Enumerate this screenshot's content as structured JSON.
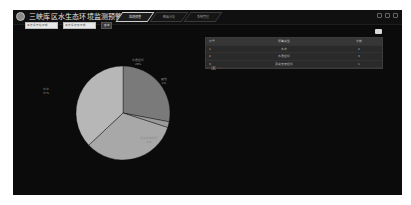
{
  "header": {
    "title": "三峡库区水生态环境监测预警平台",
    "tabs": [
      {
        "label": "监测预警",
        "active": true
      },
      {
        "label": "数据分析",
        "active": false
      },
      {
        "label": "系统管理",
        "active": false
      }
    ],
    "icons": [
      "minimize-icon",
      "settings-icon",
      "close-icon"
    ]
  },
  "toolbar": {
    "start_date": {
      "value": "",
      "placeholder": "请选择开始日期"
    },
    "end_date": {
      "value": "",
      "placeholder": "请选择结束日期"
    },
    "query_label": "查询",
    "export_icon": "export-icon"
  },
  "table": {
    "columns": [
      "序号",
      "预警类型",
      "次数"
    ],
    "rows": [
      {
        "index": "1",
        "type": "水华",
        "count": "2"
      },
      {
        "index": "2",
        "type": "水质超标",
        "count": "3"
      },
      {
        "index": "3",
        "type": "藻类密度超标",
        "count": "1"
      }
    ],
    "pagination": {
      "prev": "‹",
      "current": "1",
      "next": "›"
    }
  },
  "chart_data": {
    "type": "pie",
    "title": "",
    "slices": [
      {
        "label": "水质超标",
        "value": 28,
        "color": "#7a7a7a"
      },
      {
        "label": "其他",
        "value": 2,
        "color": "#9a9a9a"
      },
      {
        "label": "藻类密度超标",
        "value": 33,
        "color": "#a8a8a8"
      },
      {
        "label": "水华",
        "value": 37,
        "color": "#b7b7b7"
      }
    ],
    "label_texts": {
      "top_right": "水质超标\n28%",
      "right": "其他\n2%",
      "bottom_right": "藻类密度超标\n33%",
      "left": "水华\n37%"
    },
    "legend": "none"
  },
  "colors": {
    "background": "#ffffff",
    "panel": "#0b0b0b",
    "table_bg": "#2a2a2a",
    "active_tab_border": "#cfcfcf"
  }
}
